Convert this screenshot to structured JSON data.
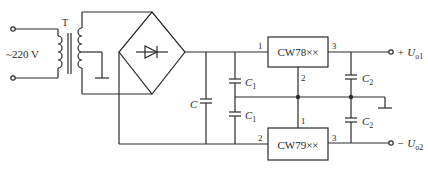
{
  "diagram": {
    "type": "dual regulated power supply circuit",
    "input": {
      "label": "~220 V"
    },
    "transformer": {
      "label": "T"
    },
    "filter_capacitor": {
      "label": "C"
    },
    "capacitors": {
      "c1_label": "C",
      "c1_sub": "1",
      "c2_label": "C",
      "c2_sub": "2"
    },
    "regulator_pos": {
      "label": "CW78××",
      "pin_in": "1",
      "pin_gnd": "2",
      "pin_out": "3"
    },
    "regulator_neg": {
      "label": "CW79××",
      "pin_gnd": "1",
      "pin_in": "2",
      "pin_out": "3"
    },
    "outputs": {
      "pos_prefix": "+ U",
      "pos_sub": "o1",
      "neg_prefix": "− U",
      "neg_sub": "o2"
    }
  }
}
